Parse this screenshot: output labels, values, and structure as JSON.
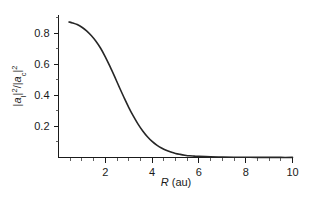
{
  "chart_data": {
    "type": "line",
    "title": "",
    "subtitle": "",
    "xlabel": "R (au)",
    "xlabel_italic_part": "R",
    "xlabel_rest": " (au)",
    "ylabel": "|a_I|^2/|a_c|^2",
    "ylabel_parts": {
      "bar1": "|",
      "a1": "a",
      "sub1": "I",
      "bar2": "|",
      "sup1": "2",
      "slash": "/",
      "bar3": "|",
      "a2": "a",
      "sub2": "c",
      "bar4": "|",
      "sup2": "2"
    },
    "xlim": [
      0,
      10
    ],
    "ylim": [
      0,
      0.92
    ],
    "grid": false,
    "legend": null,
    "x_ticks_major": [
      2,
      4,
      6,
      8,
      10
    ],
    "x_tick_labels": [
      "2",
      "4",
      "6",
      "8",
      "10"
    ],
    "x_ticks_minor": [
      0.5,
      1,
      1.5,
      2.5,
      3,
      3.5,
      4.5,
      5,
      5.5,
      6.5,
      7,
      7.5,
      8.5,
      9,
      9.5
    ],
    "y_ticks_major": [
      0.2,
      0.4,
      0.6,
      0.8
    ],
    "y_tick_labels": [
      "0.2",
      "0.4",
      "0.6",
      "0.8"
    ],
    "y_ticks_minor": [
      0.1,
      0.3,
      0.5,
      0.7,
      0.9
    ],
    "series": [
      {
        "name": "|a_I|^2/|a_c|^2 vs R",
        "color": "#262626",
        "x": [
          0.45,
          0.6,
          0.8,
          1.0,
          1.2,
          1.4,
          1.6,
          1.8,
          2.0,
          2.2,
          2.4,
          2.6,
          2.8,
          3.0,
          3.2,
          3.4,
          3.6,
          3.8,
          4.0,
          4.2,
          4.4,
          4.6,
          4.8,
          5.0,
          5.2,
          5.4,
          5.6,
          5.8,
          6.0,
          6.5,
          7.0,
          7.5,
          8.0,
          8.5,
          9.0,
          9.5,
          10.0
        ],
        "y": [
          0.872,
          0.866,
          0.855,
          0.838,
          0.815,
          0.785,
          0.748,
          0.703,
          0.648,
          0.586,
          0.52,
          0.452,
          0.386,
          0.323,
          0.266,
          0.215,
          0.171,
          0.134,
          0.104,
          0.08,
          0.061,
          0.046,
          0.035,
          0.026,
          0.02,
          0.015,
          0.011,
          0.009,
          0.007,
          0.004,
          0.003,
          0.002,
          0.0015,
          0.001,
          0.001,
          0.0005,
          0.0005
        ]
      }
    ],
    "colors": {
      "curve": "#262626",
      "axis": "#1a1a1a",
      "background": "#ffffff"
    }
  },
  "figure": {
    "background_color": "#ffffff",
    "axis_color": "#1a1a1a"
  }
}
